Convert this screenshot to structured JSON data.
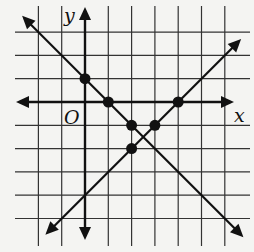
{
  "chart_data": {
    "type": "line",
    "title": "",
    "xlabel": "x",
    "ylabel": "y",
    "origin_label": "O",
    "xlim": [
      -3,
      7
    ],
    "ylim": [
      -6,
      4
    ],
    "grid": true,
    "grid_x": [
      -2,
      -1,
      0,
      1,
      2,
      3,
      4,
      5,
      6
    ],
    "grid_y": [
      -5,
      -4,
      -3,
      -2,
      -1,
      0,
      1,
      2,
      3
    ],
    "tick_labels": false,
    "series": [
      {
        "name": "line-decreasing",
        "equation": "y = -x + 1",
        "slope": -1,
        "intercept": 1,
        "x_range": [
          -2.7,
          6.8
        ],
        "arrows": "both"
      },
      {
        "name": "line-increasing",
        "equation": "y = x - 4",
        "slope": 1,
        "intercept": -4,
        "x_range": [
          -1.7,
          6.7
        ],
        "arrows": "both"
      }
    ],
    "points": [
      {
        "x": 0,
        "y": 1
      },
      {
        "x": 1,
        "y": 0
      },
      {
        "x": 2,
        "y": -1
      },
      {
        "x": 3,
        "y": -1
      },
      {
        "x": 4,
        "y": 0
      },
      {
        "x": 2,
        "y": -2
      }
    ],
    "colors": {
      "ink": "#111111",
      "grid": "#333333",
      "background": "#f4f4f2"
    }
  }
}
